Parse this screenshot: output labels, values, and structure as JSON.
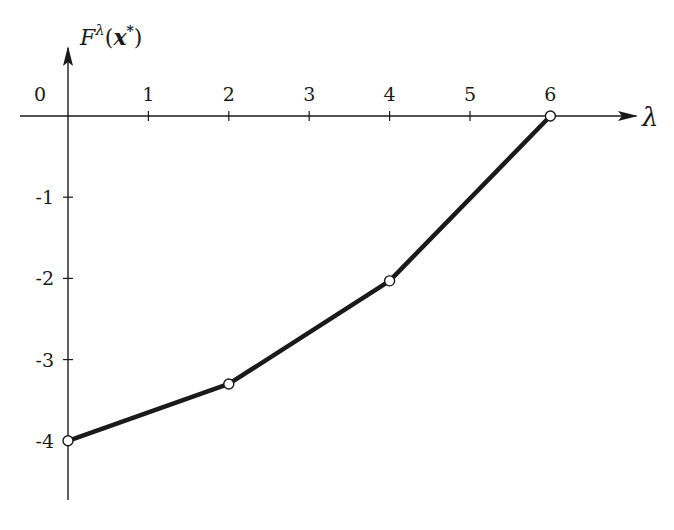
{
  "chart_data": {
    "type": "line",
    "title": "",
    "xlabel": "λ",
    "ylabel": "F^λ(x*)",
    "ylabel_parts": {
      "base": "F",
      "sup": "λ",
      "open": "(",
      "arg": "x",
      "arg_sup": "*",
      "close": ")"
    },
    "x": [
      0,
      2,
      4,
      6
    ],
    "values": [
      -4,
      -3.3,
      -2.03,
      0
    ],
    "series": [
      {
        "name": "F^λ(x*)",
        "x": [
          0,
          2,
          4,
          6
        ],
        "values": [
          -4,
          -3.3,
          -2.03,
          0
        ],
        "marker": "open-circle"
      }
    ],
    "x_ticks": [
      "0",
      "1",
      "2",
      "3",
      "4",
      "5",
      "6"
    ],
    "y_ticks": [
      "-1",
      "-2",
      "-3",
      "-4"
    ],
    "xlim": [
      -0.6,
      7.0
    ],
    "ylim": [
      -4.7,
      0.9
    ],
    "grid": false,
    "legend": "none",
    "colors": {
      "line": "#1a1a1a",
      "axis": "#1a1a1a",
      "marker_fill": "#ffffff"
    }
  }
}
